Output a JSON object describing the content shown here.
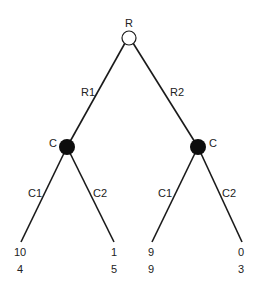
{
  "diagram": {
    "type": "game-tree",
    "root": {
      "label": "R",
      "style": "open-circle"
    },
    "root_branches": [
      "R1",
      "R2"
    ],
    "decision_nodes": [
      {
        "label": "C",
        "style": "filled-circle",
        "branches": [
          "C1",
          "C2"
        ]
      },
      {
        "label": "C",
        "style": "filled-circle",
        "branches": [
          "C1",
          "C2"
        ]
      }
    ],
    "leaves": [
      {
        "payoff_top": "10",
        "payoff_bottom": "4"
      },
      {
        "payoff_top": "1",
        "payoff_bottom": "5"
      },
      {
        "payoff_top": "9",
        "payoff_bottom": "9"
      },
      {
        "payoff_top": "0",
        "payoff_bottom": "3"
      }
    ]
  },
  "colors": {
    "line": "#1a1a1a",
    "text": "#222222",
    "background": "#ffffff"
  }
}
